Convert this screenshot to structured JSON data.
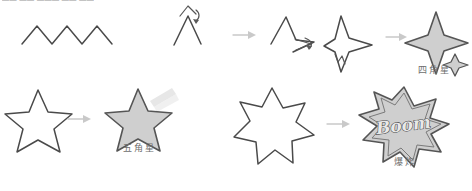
{
  "page": {
    "top_text": "▬▬ ▬▬ ▬▬▬ ▬▬ ▬▬",
    "background": "#ffffff",
    "stroke_color": "#4a4a4a",
    "fill_color": "#cfcfcf",
    "arrow_color": "#c9c9c9",
    "label_color": "#6d6d6d"
  },
  "rows": [
    {
      "id": "row-four-point-star",
      "label": "四角星",
      "steps": [
        {
          "id": "zigzag",
          "name": "zigzag-line",
          "kind": "outline",
          "peaks": 4
        },
        {
          "id": "chevron",
          "name": "chevron-with-rotate-arrow",
          "kind": "outline"
        },
        {
          "id": "partial-star",
          "name": "partial-star-with-arrow",
          "kind": "outline"
        },
        {
          "id": "four-point-outline",
          "name": "four-point-star-outline",
          "kind": "outline"
        },
        {
          "id": "four-point-filled",
          "name": "four-point-star-filled",
          "kind": "filled"
        }
      ]
    },
    {
      "id": "row-five-point-star",
      "label": "五角星",
      "steps": [
        {
          "id": "five-point-outline",
          "name": "five-point-star-outline",
          "kind": "outline"
        },
        {
          "id": "five-point-filled",
          "name": "five-point-star-filled",
          "kind": "filled"
        }
      ]
    },
    {
      "id": "row-explosion",
      "label": "爆炸",
      "boom_text": "Boom",
      "steps": [
        {
          "id": "seven-point-outline",
          "name": "seven-point-star-outline",
          "kind": "outline"
        },
        {
          "id": "explosion-filled",
          "name": "explosion-burst-filled",
          "kind": "filled"
        }
      ]
    }
  ]
}
